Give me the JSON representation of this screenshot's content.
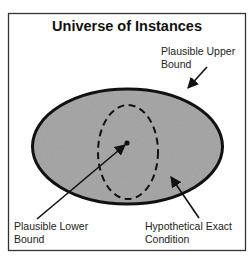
{
  "diagram": {
    "title": "Universe of Instances",
    "labels": {
      "upper_bound": [
        "Plausible Upper",
        "Bound"
      ],
      "lower_bound": [
        "Plausible Lower",
        "Bound"
      ],
      "exact_condition": [
        "Hypothetical Exact",
        "Condition"
      ]
    },
    "colors": {
      "frame": "#333333",
      "region_fill": "#a9a9a9",
      "outline": "#111111",
      "background": "#ffffff"
    },
    "elements": {
      "outer_region": "Plausible Upper Bound (solid ellipse, grey fill)",
      "inner_region": "Hypothetical Exact Condition (dashed ellipse)",
      "point": "Plausible Lower Bound (center dot)"
    }
  }
}
